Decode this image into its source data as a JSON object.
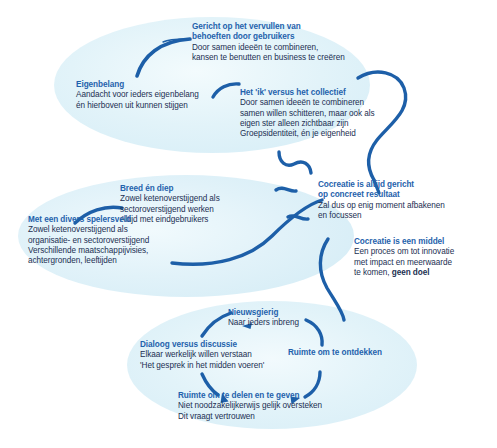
{
  "diagram": {
    "title_text": "",
    "colors": {
      "blob_fill": "#dff0f7",
      "blob_fill_soft": "#e8f5fa",
      "heading_blue": "#1f62ac",
      "body_navy": "#1c2f52",
      "arrow_blue": "#1d5fa8",
      "background": "#ffffff"
    },
    "blobs": [
      {
        "name": "top-ellipse"
      },
      {
        "name": "middle-ellipse"
      },
      {
        "name": "bottom-ellipse"
      }
    ],
    "nodes": [
      {
        "id": "gericht-op-het-vervullen",
        "heading": [
          "Gericht op het vervullen van",
          "behoeften door gebruikers"
        ],
        "lines": [
          "Door samen ideeën te combineren,",
          "kansen te benutten en business te creëren"
        ]
      },
      {
        "id": "eigenbelang",
        "heading": [
          "Eigenbelang"
        ],
        "lines": [
          "Aandacht voor ieders eigenbelang",
          "én hierboven uit kunnen stijgen"
        ]
      },
      {
        "id": "het-ik-versus-het-collectief",
        "heading": [
          "Het 'ik' versus het collectief"
        ],
        "lines": [
          "Door samen ideeën te combineren",
          "samen willen schitteren, maar ook als",
          "eigen ster alleen zichtbaar zijn",
          "Groepsidentiteit, én je eigenheid"
        ]
      },
      {
        "id": "breed-en-diep",
        "heading": [
          "Breed én diep"
        ],
        "lines": [
          "Zowel ketenoverstijgend als",
          "sectoroverstijgend werken",
          "Altijd met eindgebruikers"
        ]
      },
      {
        "id": "met-een-divers-spelersveld",
        "heading": [
          "Met een divers spelersveld"
        ],
        "lines": [
          "Zowel ketenoverstijgend als",
          "organisatie- en sectoroverstijgend",
          "Verschillende maatschappijvisies,",
          "achtergronden, leeftijden"
        ]
      },
      {
        "id": "cocreatie-is-altijd-gericht",
        "heading": [
          "Cocreatie is altijd gericht",
          "op concreet resultaat"
        ],
        "lines": [
          "Zal dus op enig moment afbakenen",
          "en focussen"
        ]
      },
      {
        "id": "cocreatie-is-een-middel",
        "heading": [
          "Cocreatie is een middel"
        ],
        "lines": [
          "Een proces om tot innovatie",
          "met impact en meerwaarde"
        ],
        "last_line_prefix": "te komen, ",
        "last_line_bold": "geen doel"
      },
      {
        "id": "nieuwsgierig",
        "heading": [
          "Nieuwsgierig"
        ],
        "lines": [
          "Naar ieders inbreng"
        ]
      },
      {
        "id": "dialoog-versus-discussie",
        "heading": [
          "Dialoog versus discussie"
        ],
        "lines": [
          "Elkaar werkelijk willen verstaan",
          "'Het gesprek in het midden voeren'"
        ]
      },
      {
        "id": "ruimte-om-te-ontdekken",
        "heading": [
          "Ruimte om te ontdekken"
        ],
        "lines": []
      },
      {
        "id": "ruimte-om-te-delen-en-te-geven",
        "heading": [
          "Ruimte om te delen en te geven"
        ],
        "lines": [
          "Niet noodzakelijkerwijs gelijk oversteken",
          "Dit vraagt vertrouwen"
        ]
      }
    ]
  }
}
